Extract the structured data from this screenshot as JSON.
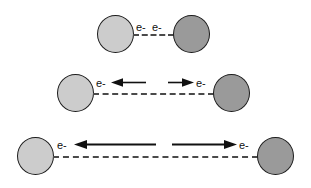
{
  "figure": {
    "background_color": "#ffffff",
    "colors": {
      "atom_light_fill": "#cccccc",
      "atom_dark_fill": "#9a9a9a",
      "atom_outline": "#1c1c1c",
      "bond_line": "#4a4a4a",
      "arrow": "#111111",
      "label_text": "#111111"
    },
    "rows": [
      {
        "id": "row-1",
        "left_atom_shade": "light",
        "right_atom_shade": "dark",
        "bond_style": "dashed",
        "labels": [
          "e-",
          "e-"
        ],
        "arrows": []
      },
      {
        "id": "row-2",
        "left_atom_shade": "light",
        "right_atom_shade": "dark",
        "bond_style": "dashed",
        "labels": [
          "e-",
          "e-"
        ],
        "arrows": [
          "left",
          "right"
        ]
      },
      {
        "id": "row-3",
        "left_atom_shade": "light",
        "right_atom_shade": "dark",
        "bond_style": "dashed",
        "labels": [
          "e-",
          "e-"
        ],
        "arrows": [
          "left",
          "right"
        ]
      }
    ]
  }
}
